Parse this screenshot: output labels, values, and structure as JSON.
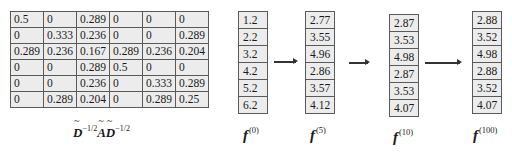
{
  "matrix": {
    "label_parts": [
      "D",
      "−1/2",
      "A",
      "D",
      "−1/2"
    ],
    "label_text": "D̃^(-1/2) Ã D̃^(-1/2)",
    "rows": [
      [
        "0.5",
        "0",
        "0.289",
        "0",
        "0",
        "0"
      ],
      [
        "0",
        "0.333",
        "0.236",
        "0",
        "0",
        "0.289"
      ],
      [
        "0.289",
        "0.236",
        "0.167",
        "0.289",
        "0.236",
        "0.204"
      ],
      [
        "0",
        "0",
        "0.289",
        "0.5",
        "0",
        "0"
      ],
      [
        "0",
        "0",
        "0.236",
        "0",
        "0.333",
        "0.289"
      ],
      [
        "0",
        "0.289",
        "0.204",
        "0",
        "0.289",
        "0.25"
      ]
    ]
  },
  "vectors": [
    {
      "name": "f",
      "superscript": "(0)",
      "values": [
        "1.2",
        "2.2",
        "3.2",
        "4.2",
        "5.2",
        "6.2"
      ]
    },
    {
      "name": "f",
      "superscript": "(5)",
      "values": [
        "2.77",
        "3.55",
        "4.96",
        "2.86",
        "3.57",
        "4.12"
      ]
    },
    {
      "name": "f",
      "superscript": "(10)",
      "values": [
        "2.87",
        "3.53",
        "4.98",
        "2.87",
        "3.53",
        "4.07"
      ]
    },
    {
      "name": "f",
      "superscript": "(100)",
      "values": [
        "2.88",
        "3.52",
        "4.98",
        "2.88",
        "3.52",
        "4.07"
      ]
    }
  ],
  "arrows": [
    "right-arrow",
    "right-arrow",
    "right-arrow"
  ],
  "colors": {
    "cell_bg": "#ececec",
    "border": "#5a5a5a",
    "arrow": "#333333"
  }
}
